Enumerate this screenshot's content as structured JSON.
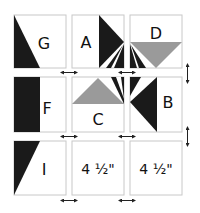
{
  "diagram": {
    "title": "",
    "colors": {
      "dark": "#1a1a1a",
      "gray": "#9a9a9a",
      "border": "#c8c8c8",
      "arrow": "#222222"
    },
    "blocks": [
      {
        "id": "G",
        "label": "G",
        "row": 0,
        "col": 0
      },
      {
        "id": "A",
        "label": "A",
        "row": 0,
        "col": 1
      },
      {
        "id": "D",
        "label": "D",
        "row": 0,
        "col": 2
      },
      {
        "id": "F",
        "label": "F",
        "row": 1,
        "col": 0
      },
      {
        "id": "C",
        "label": "C",
        "row": 1,
        "col": 1
      },
      {
        "id": "B",
        "label": "B",
        "row": 1,
        "col": 2
      },
      {
        "id": "I",
        "label": "I",
        "row": 2,
        "col": 0
      },
      {
        "id": "plain1",
        "label": "4 ½\"",
        "row": 2,
        "col": 1
      },
      {
        "id": "plain2",
        "label": "4 ½\"",
        "row": 2,
        "col": 2
      }
    ],
    "spacing_arrows": {
      "horizontal": [
        "double-arrow-h",
        "double-arrow-h",
        "double-arrow-h",
        "double-arrow-h",
        "double-arrow-h",
        "double-arrow-h"
      ],
      "vertical": [
        "double-arrow-v",
        "double-arrow-v"
      ]
    }
  }
}
